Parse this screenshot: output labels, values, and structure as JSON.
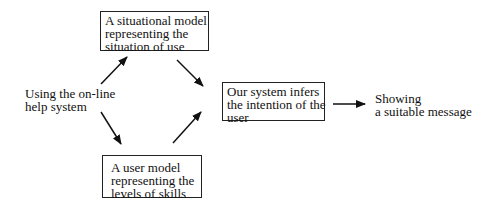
{
  "nodes": {
    "input": {
      "lines": [
        "Using the on-line",
        "help system"
      ]
    },
    "situational_model": {
      "lines": [
        "A situational model",
        "representing the",
        "situation of use"
      ]
    },
    "user_model": {
      "lines": [
        "A user model",
        "representing the",
        "levels of skills"
      ]
    },
    "inference": {
      "lines": [
        "Our system infers",
        "the intention of the",
        "user"
      ]
    },
    "output": {
      "lines": [
        "Showing",
        "a suitable message"
      ]
    }
  },
  "edges": [
    {
      "from": "input",
      "to": "situational_model"
    },
    {
      "from": "input",
      "to": "user_model"
    },
    {
      "from": "situational_model",
      "to": "inference"
    },
    {
      "from": "user_model",
      "to": "inference"
    },
    {
      "from": "inference",
      "to": "output"
    }
  ]
}
